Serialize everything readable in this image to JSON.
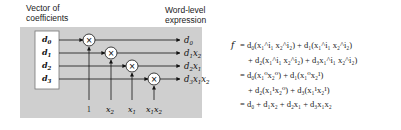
{
  "diagram": {
    "left_label": [
      "Vector of",
      "coefficients"
    ],
    "right_label": [
      "Word-level",
      "expression"
    ],
    "coefficients": [
      "d",
      "d",
      "d",
      "d"
    ],
    "coefficient_subscripts": [
      "0",
      "1",
      "2",
      "3"
    ],
    "multiplier_symbol": "×",
    "inputs": [
      {
        "base": "1",
        "sub": ""
      },
      {
        "base": "x",
        "sub": "2"
      },
      {
        "base": "x",
        "sub": "1"
      },
      {
        "base": "x",
        "sub": "1",
        "base2": "x",
        "sub2": "2"
      }
    ],
    "outputs": [
      {
        "parts": [
          [
            "d",
            "0"
          ]
        ]
      },
      {
        "parts": [
          [
            "d",
            "1"
          ],
          [
            "x",
            "2"
          ]
        ]
      },
      {
        "parts": [
          [
            "d",
            "2"
          ],
          [
            "x",
            "1"
          ]
        ]
      },
      {
        "parts": [
          [
            "d",
            "3"
          ],
          [
            "x",
            "1"
          ],
          [
            "x",
            "2"
          ]
        ]
      }
    ],
    "colors": {
      "panel_bg": "#cfcfcf",
      "box_bg": "#ffffff",
      "line": "#111111"
    }
  },
  "equation": {
    "lhs": "f",
    "lines": [
      "= d₀(x₁^i₁ x₂^i₂) + d₁(x₁^i₁ x₂^i₂)",
      "+ d₂(x₁^i₁ x₂^i₂) + d₃x₁^i₁ x₂^i₂)",
      "= d₀(x₁⁰x₂⁰) + d₁(x₁⁰x₂¹)",
      "+ d₂(x₁¹x₂⁰) + d₃(x₁¹x₂¹)",
      "= d₀ + d₁x₂ + d₂x₁ + d₃x₁x₂"
    ]
  }
}
